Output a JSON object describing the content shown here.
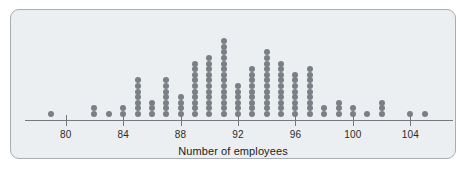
{
  "figure": {
    "background_color": "#eceff1",
    "border_color": "#a9aeb2",
    "dot_color": "#7b7f86",
    "axis_color": "#76797c"
  },
  "chart_data": {
    "type": "scatter",
    "plot_style": "dotplot",
    "title": "",
    "xlabel": "Number of employees",
    "ylabel": "",
    "xlim": [
      78,
      106
    ],
    "grid": false,
    "legend": null,
    "tick_labels": [
      "80",
      "84",
      "88",
      "92",
      "96",
      "100",
      "104"
    ],
    "tick_values": [
      80,
      84,
      88,
      92,
      96,
      100,
      104
    ],
    "categories": [
      79,
      80,
      81,
      82,
      83,
      84,
      85,
      86,
      87,
      88,
      89,
      90,
      91,
      92,
      93,
      94,
      95,
      96,
      97,
      98,
      99,
      100,
      101,
      102,
      103,
      104,
      105
    ],
    "values": [
      1,
      0,
      0,
      2,
      1,
      2,
      7,
      3,
      7,
      4,
      10,
      11,
      14,
      6,
      9,
      12,
      10,
      8,
      9,
      2,
      3,
      2,
      1,
      3,
      0,
      1,
      1
    ],
    "total_count": 119
  },
  "axis": {
    "label": "Number of employees"
  }
}
